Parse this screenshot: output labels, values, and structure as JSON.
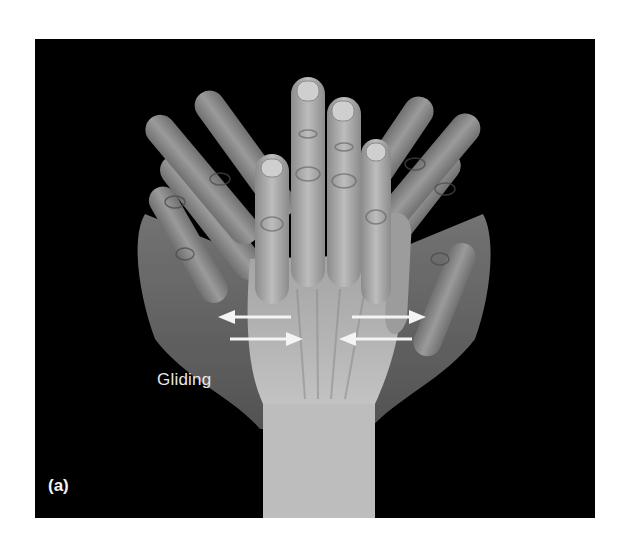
{
  "figure": {
    "panel_label": "(a)",
    "motion_label": "Gliding",
    "background_color": "#000000",
    "page_color": "#ffffff",
    "arrow_color": "#f4f4f4",
    "arrows": [
      {
        "id": "upper-left",
        "direction": "left"
      },
      {
        "id": "upper-right",
        "direction": "right"
      },
      {
        "id": "lower-left",
        "direction": "right"
      },
      {
        "id": "lower-right",
        "direction": "left"
      }
    ]
  }
}
